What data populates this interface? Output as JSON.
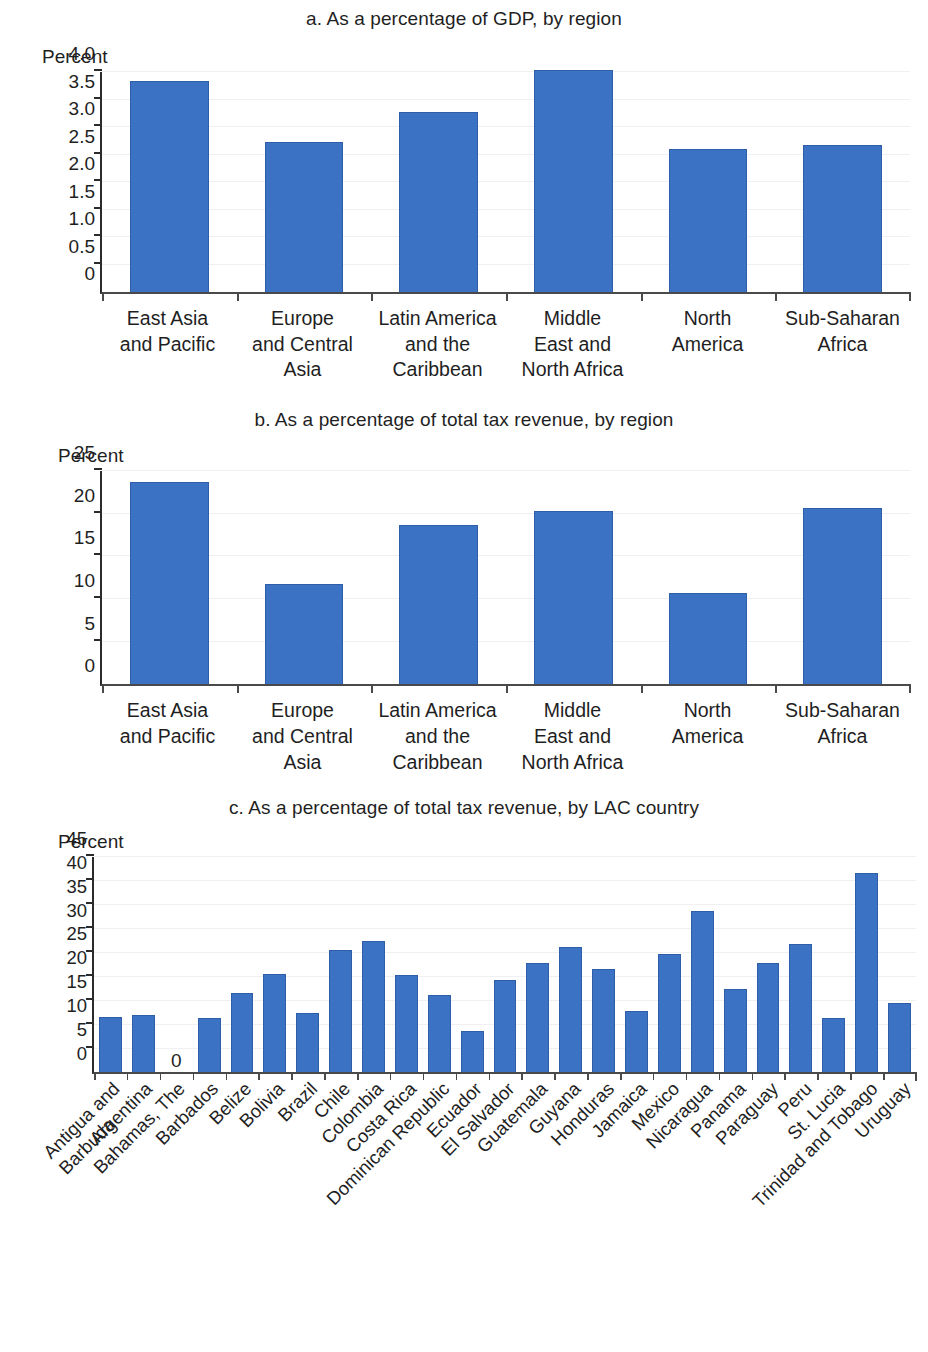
{
  "colors": {
    "bar_fill": "#3b72c4",
    "bar_stroke": "#2e5ea8",
    "axis": "#2b2b2b",
    "text": "#1f1f1f",
    "gridline": "#f0f0f2",
    "background": "#ffffff"
  },
  "axis_unit_label": "Percent",
  "panels": {
    "a": {
      "title": "a. As a percentage of GDP, by region",
      "unit": "Percent"
    },
    "b": {
      "title": "b. As a percentage of total tax revenue, by region",
      "unit": "Percent"
    },
    "c": {
      "title": "c. As a percentage of total tax revenue, by LAC country",
      "unit": "Percent",
      "zero_annotation": "0"
    }
  },
  "chart_data": [
    {
      "type": "bar",
      "panel": "a",
      "title": "a. As a percentage of GDP, by region",
      "xlabel": "",
      "ylabel": "Percent",
      "ylim": [
        0,
        4.0
      ],
      "yticks": [
        0,
        0.5,
        1.0,
        1.5,
        2.0,
        2.5,
        3.0,
        3.5,
        4.0
      ],
      "ytick_labels": [
        "0",
        "0.5",
        "1.0",
        "1.5",
        "2.0",
        "2.5",
        "3.0",
        "3.5",
        "4.0"
      ],
      "grid": true,
      "legend": "none",
      "categories": [
        "East Asia and Pacific",
        "Europe and Central Asia",
        "Latin America and the Caribbean",
        "Middle East and North Africa",
        "North America",
        "Sub-Saharan Africa"
      ],
      "category_lines": [
        [
          "East Asia",
          "and Pacific"
        ],
        [
          "Europe",
          "and Central",
          "Asia"
        ],
        [
          "Latin America",
          "and the",
          "Caribbean"
        ],
        [
          "Middle",
          "East and",
          "North Africa"
        ],
        [
          "North",
          "America"
        ],
        [
          "Sub-Saharan",
          "Africa"
        ]
      ],
      "values": [
        3.83,
        2.72,
        3.28,
        4.03,
        2.6,
        2.68
      ]
    },
    {
      "type": "bar",
      "panel": "b",
      "title": "b. As a percentage of total tax revenue, by region",
      "xlabel": "",
      "ylabel": "Percent",
      "ylim": [
        0,
        25
      ],
      "yticks": [
        0,
        5,
        10,
        15,
        20,
        25
      ],
      "ytick_labels": [
        "0",
        "5",
        "10",
        "15",
        "20",
        "25"
      ],
      "grid": true,
      "legend": "none",
      "categories": [
        "East Asia and Pacific",
        "Europe and Central Asia",
        "Latin America and the Caribbean",
        "Middle East and North Africa",
        "North America",
        "Sub-Saharan Africa"
      ],
      "category_lines": [
        [
          "East Asia",
          "and Pacific"
        ],
        [
          "Europe",
          "and Central",
          "Asia"
        ],
        [
          "Latin America",
          "and the",
          "Caribbean"
        ],
        [
          "Middle",
          "East and",
          "North Africa"
        ],
        [
          "North",
          "America"
        ],
        [
          "Sub-Saharan",
          "Africa"
        ]
      ],
      "values": [
        23.7,
        11.8,
        18.7,
        20.3,
        10.7,
        20.7
      ]
    },
    {
      "type": "bar",
      "panel": "c",
      "title": "c. As a percentage of total tax revenue, by LAC country",
      "xlabel": "",
      "ylabel": "Percent",
      "ylim": [
        0,
        45
      ],
      "yticks": [
        0,
        5,
        10,
        15,
        20,
        25,
        30,
        35,
        40,
        45
      ],
      "ytick_labels": [
        "0",
        "5",
        "10",
        "15",
        "20",
        "25",
        "30",
        "35",
        "40",
        "45"
      ],
      "grid": true,
      "legend": "none",
      "data_labels": {
        "Bahamas, The": "0"
      },
      "categories": [
        "Antigua and Barbuda",
        "Argentina",
        "Bahamas, The",
        "Barbados",
        "Belize",
        "Bolivia",
        "Brazil",
        "Chile",
        "Colombia",
        "Costa Rica",
        "Dominican Republic",
        "Ecuador",
        "El Salvador",
        "Guatemala",
        "Guyana",
        "Honduras",
        "Jamaica",
        "Mexico",
        "Nicaragua",
        "Panama",
        "Paraguay",
        "Peru",
        "St. Lucia",
        "Trinidad and Tobago",
        "Uruguay"
      ],
      "category_lines": [
        [
          "Antigua and",
          "Barbuda"
        ],
        [
          "Argentina"
        ],
        [
          "Bahamas, The"
        ],
        [
          "Barbados"
        ],
        [
          "Belize"
        ],
        [
          "Bolivia"
        ],
        [
          "Brazil"
        ],
        [
          "Chile"
        ],
        [
          "Colombia"
        ],
        [
          "Costa Rica"
        ],
        [
          "Dominican Republic"
        ],
        [
          "Ecuador"
        ],
        [
          "El Salvador"
        ],
        [
          "Guatemala"
        ],
        [
          "Guyana"
        ],
        [
          "Honduras"
        ],
        [
          "Jamaica"
        ],
        [
          "Mexico"
        ],
        [
          "Nicaragua"
        ],
        [
          "Panama"
        ],
        [
          "Paraguay"
        ],
        [
          "Peru"
        ],
        [
          "St. Lucia"
        ],
        [
          "Trinidad and Tobago"
        ],
        [
          "Uruguay"
        ]
      ],
      "values": [
        11.7,
        12.0,
        0,
        11.3,
        16.7,
        20.6,
        12.5,
        25.6,
        27.5,
        20.3,
        16.2,
        8.7,
        19.4,
        23.0,
        26.3,
        21.6,
        12.9,
        24.7,
        33.8,
        17.5,
        22.9,
        26.9,
        11.3,
        41.8,
        14.5
      ]
    }
  ]
}
